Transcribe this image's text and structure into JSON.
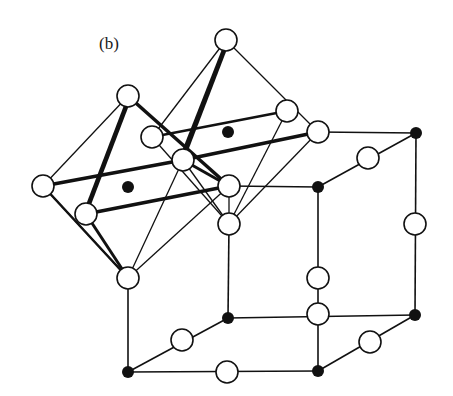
{
  "figure": {
    "label": "(b)"
  },
  "colors": {
    "line": "#111111",
    "open_atom_fill": "#ffffff",
    "filled_atom": "#111111",
    "background": "#ffffff"
  },
  "atoms": {
    "open": [
      [
        128,
        96
      ],
      [
        226,
        40
      ],
      [
        152,
        137
      ],
      [
        183,
        160
      ],
      [
        287,
        111
      ],
      [
        318,
        132
      ],
      [
        43,
        186
      ],
      [
        86,
        214
      ],
      [
        229,
        186
      ],
      [
        229,
        224
      ],
      [
        128,
        278
      ],
      [
        368,
        158
      ],
      [
        415,
        224
      ],
      [
        318,
        278
      ],
      [
        318,
        314
      ],
      [
        182,
        340
      ],
      [
        370,
        342
      ],
      [
        227,
        372
      ]
    ],
    "filled": [
      [
        128,
        187
      ],
      [
        228,
        132
      ],
      [
        318,
        187
      ],
      [
        416,
        133
      ],
      [
        228,
        318
      ],
      [
        415,
        315
      ],
      [
        128,
        372
      ],
      [
        318,
        371
      ]
    ]
  }
}
